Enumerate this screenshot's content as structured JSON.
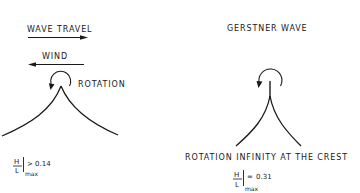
{
  "left_panel": {
    "wave_travel_label": "WAVE TRAVEL",
    "wave_travel_direction": "right",
    "wind_label": "WIND",
    "wind_direction": "left",
    "rotation_label": "ROTATION",
    "rotation_icon": "counterclockwise-rotation-arrow",
    "crest_shape": "sharp-cusp-crest",
    "ratio": {
      "numerator": "H",
      "denominator": "L",
      "subscript": "max",
      "operator": ">",
      "value": "0.14"
    }
  },
  "right_panel": {
    "title": "GERSTNER WAVE",
    "rotation_icon": "counterclockwise-rotation-arrow",
    "crest_shape": "trochoidal-cusp-crest",
    "caption": "ROTATION INFINITY AT THE CREST",
    "ratio": {
      "numerator": "H",
      "denominator": "L",
      "subscript": "max",
      "operator": "=",
      "value": "0.31"
    }
  },
  "colors": {
    "ink": "#1a1a1a",
    "background": "#ffffff"
  }
}
